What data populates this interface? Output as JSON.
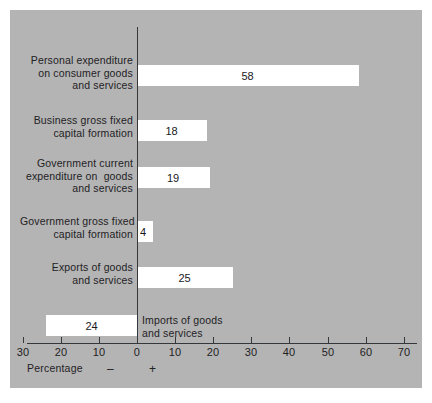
{
  "chart_data": {
    "type": "bar",
    "orientation": "horizontal",
    "title": "",
    "xlabel": "Percentage",
    "ylabel": "",
    "xlim": [
      -30,
      70
    ],
    "xticks": [
      -30,
      -20,
      -10,
      0,
      10,
      20,
      30,
      40,
      50,
      60,
      70
    ],
    "xticklabels": [
      "30",
      "20",
      "10",
      "0",
      "10",
      "20",
      "30",
      "40",
      "50",
      "60",
      "70"
    ],
    "grid": false,
    "legend": null,
    "negative_sign_marker": "–",
    "positive_sign_marker": "+",
    "categories": [
      "Personal expenditure\non consumer goods\nand services",
      "Business gross fixed\ncapital formation",
      "Government current\nexpenditure on  goods\nand services",
      "Government gross fixed\ncapital formation",
      "Exports of goods\nand services",
      "Imports of goods\nand services"
    ],
    "values": [
      58,
      18,
      19,
      4,
      25,
      -24
    ],
    "value_labels": [
      "58",
      "18",
      "19",
      "4",
      "25",
      "24"
    ],
    "bar_color": "#ffffff",
    "panel_color": "#b4b4b4",
    "axis_color": "#35383a"
  },
  "axis": {
    "caption": "Percentage",
    "minus": "–",
    "plus": "+",
    "ticks": [
      {
        "label": "30",
        "value": -30
      },
      {
        "label": "20",
        "value": -20
      },
      {
        "label": "10",
        "value": -10
      },
      {
        "label": "0",
        "value": 0
      },
      {
        "label": "10",
        "value": 10
      },
      {
        "label": "20",
        "value": 20
      },
      {
        "label": "30",
        "value": 30
      },
      {
        "label": "40",
        "value": 40
      },
      {
        "label": "50",
        "value": 50
      },
      {
        "label": "60",
        "value": 60
      },
      {
        "label": "70",
        "value": 70
      }
    ]
  },
  "bars": [
    {
      "label_lines": [
        "Personal expenditure",
        "on consumer goods",
        "and services"
      ],
      "label_side": "left",
      "value": 58,
      "value_label": "58"
    },
    {
      "label_lines": [
        "Business gross fixed",
        "capital formation"
      ],
      "label_side": "left",
      "value": 18,
      "value_label": "18"
    },
    {
      "label_lines": [
        "Government current",
        "expenditure on  goods",
        "and services"
      ],
      "label_side": "left",
      "value": 19,
      "value_label": "19"
    },
    {
      "label_lines": [
        "Government gross fixed",
        "capital formation"
      ],
      "label_side": "left",
      "value": 4,
      "value_label": "4"
    },
    {
      "label_lines": [
        "Exports of goods",
        "and services"
      ],
      "label_side": "left",
      "value": 25,
      "value_label": "25"
    },
    {
      "label_lines": [
        "Imports of goods",
        "and services"
      ],
      "label_side": "right",
      "value": -24,
      "value_label": "24"
    }
  ],
  "source_note": ""
}
